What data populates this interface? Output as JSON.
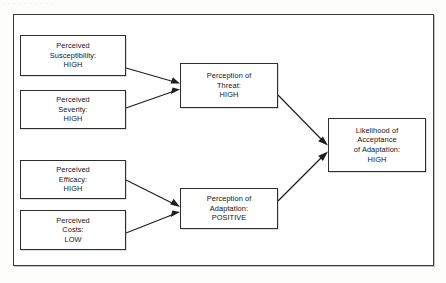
{
  "page": {
    "top_remnant_text": "· · ·  · · · · · · ·",
    "background_color": "#fdfdfc",
    "frame_border_color": "#3a3a3a",
    "node_border_color": "#2e2e2e",
    "text_color": "#141414",
    "arrow_color": "#1e1e1e"
  },
  "diagram": {
    "type": "flow-diagram",
    "nodes": [
      {
        "id": "perceived-susceptibility",
        "lines": [
          "Perceived",
          "Susceptibility:",
          "HIGH"
        ],
        "value": "HIGH"
      },
      {
        "id": "perceived-severity",
        "lines": [
          "Perceived",
          "Severity:",
          "HIGH"
        ],
        "value": "HIGH"
      },
      {
        "id": "perceived-efficacy",
        "lines": [
          "Perceived",
          "Efficacy:",
          "HIGH"
        ],
        "value": "HIGH"
      },
      {
        "id": "perceived-costs",
        "lines": [
          "Perceived",
          "Costs:",
          "LOW"
        ],
        "value": "LOW"
      },
      {
        "id": "perception-of-threat",
        "lines": [
          "Perception of",
          "Threat:",
          "HIGH"
        ],
        "value": "HIGH"
      },
      {
        "id": "perception-of-adaptation",
        "lines": [
          "Perception of",
          "Adaptation:",
          "POSITIVE"
        ],
        "value": "POSITIVE"
      },
      {
        "id": "likelihood-of-acceptance",
        "lines": [
          "Likelihood of",
          "Acceptance",
          "of Adaptation:",
          "HIGH"
        ],
        "value": "HIGH"
      }
    ],
    "edges": [
      {
        "from": "perceived-susceptibility",
        "to": "perception-of-threat"
      },
      {
        "from": "perceived-severity",
        "to": "perception-of-threat"
      },
      {
        "from": "perceived-efficacy",
        "to": "perception-of-adaptation"
      },
      {
        "from": "perceived-costs",
        "to": "perception-of-adaptation"
      },
      {
        "from": "perception-of-threat",
        "to": "likelihood-of-acceptance"
      },
      {
        "from": "perception-of-adaptation",
        "to": "likelihood-of-acceptance"
      }
    ]
  }
}
